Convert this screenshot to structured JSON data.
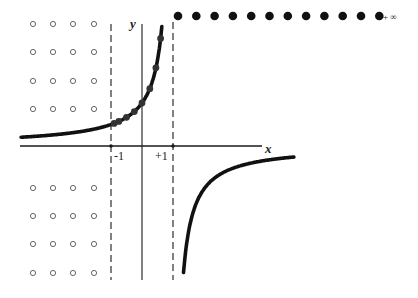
{
  "diagram": {
    "function": "y = 1/(1 - x)",
    "axes": {
      "x_label": "x",
      "y_label": "y"
    },
    "asymptote_labels": [
      "-1",
      "+1"
    ],
    "infinity_label": "+ ∞",
    "open_dot_grid": {
      "rows_above": 4,
      "rows_below": 4,
      "cols": 4
    },
    "filled_dots_top_count": 12,
    "curve_point_x_values": [
      -0.9,
      -0.75,
      -0.5,
      -0.25,
      0,
      0.25,
      0.45,
      0.6,
      0.72
    ],
    "colors": {
      "ink": "#1a1a1a",
      "open_dot": "#555555",
      "background": "#ffffff"
    }
  }
}
